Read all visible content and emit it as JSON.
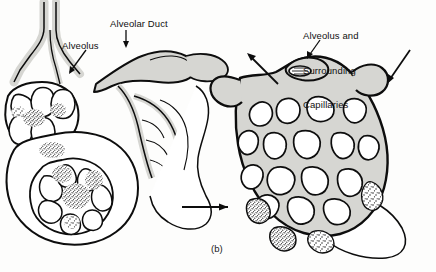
{
  "figure": {
    "caption": "(b)",
    "background_color": "#fdfdfc",
    "ink_color": "#0d0d0d",
    "tissue_fill_color": "#d6d6d2",
    "labels": {
      "alveolar_duct": "Alveolar Duct",
      "alveolus": "Alveolus",
      "alveolus_and_capillaries_line1": "Alveolus and",
      "alveolus_and_capillaries_line2": "Surrounding",
      "alveolus_and_capillaries_line3": "Capillaries"
    },
    "panels": [
      {
        "id": "left-panel",
        "name": "alveolar-duct-and-sacs-diagram",
        "description": "Branching alveolar duct with clusters of alveolar sacs and capillary stippling"
      },
      {
        "id": "right-panel",
        "name": "alveolus-capillary-network-diagram",
        "description": "Magnified single alveolus covered by a dense mesh of surrounding capillaries"
      }
    ],
    "arrows": [
      {
        "name": "magnification-arrow",
        "direction": "right",
        "description": "Links left panel to magnified right panel"
      },
      {
        "name": "airflow-out-arrow",
        "direction": "up-left",
        "description": "Arrow pointing away from capillary network"
      },
      {
        "name": "airflow-in-arrow",
        "direction": "down-left",
        "description": "Arrow pointing into capillary network"
      },
      {
        "name": "alveolar-duct-leader",
        "direction": "down-left",
        "description": "Leader line from Alveolar Duct label"
      },
      {
        "name": "alveolus-leader",
        "direction": "down-left",
        "description": "Leader line from Alveolus label"
      },
      {
        "name": "alveolus-capillaries-leader",
        "direction": "down",
        "description": "Leader line from Alveolus and Surrounding Capillaries label"
      }
    ]
  }
}
